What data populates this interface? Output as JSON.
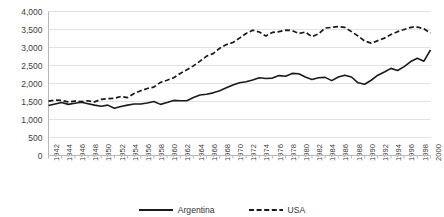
{
  "chart_data": {
    "type": "line",
    "title": "",
    "subtitle": "",
    "xlabel": "",
    "ylabel": "",
    "ylim": [
      0,
      4000
    ],
    "xlim": [
      1942,
      2000
    ],
    "grid": true,
    "grid_axis": "y",
    "legend_position": "bottom",
    "y_ticks": [
      0,
      500,
      1000,
      1500,
      2000,
      2500,
      3000,
      3500,
      4000
    ],
    "y_tick_labels": [
      "0",
      "500",
      "1,000",
      "1,500",
      "2,000",
      "2,500",
      "3,000",
      "3,500",
      "4,000"
    ],
    "x_tick_labels": [
      "1942",
      "1944",
      "1946",
      "1948",
      "1950",
      "1952",
      "1954",
      "1956",
      "1958",
      "1960",
      "1962",
      "1964",
      "1966",
      "1968",
      "1970",
      "1972",
      "1974",
      "1976",
      "1978",
      "1980",
      "1982",
      "1984",
      "1986",
      "1988",
      "1990",
      "1992",
      "1994",
      "1996",
      "1998",
      "2000"
    ],
    "x": [
      1942,
      1943,
      1944,
      1945,
      1946,
      1947,
      1948,
      1949,
      1950,
      1951,
      1952,
      1953,
      1954,
      1955,
      1956,
      1957,
      1958,
      1959,
      1960,
      1961,
      1962,
      1963,
      1964,
      1965,
      1966,
      1967,
      1968,
      1969,
      1970,
      1971,
      1972,
      1973,
      1974,
      1975,
      1976,
      1977,
      1978,
      1979,
      1980,
      1981,
      1982,
      1983,
      1984,
      1985,
      1986,
      1987,
      1988,
      1989,
      1990,
      1991,
      1992,
      1993,
      1994,
      1995,
      1996,
      1997,
      1998,
      1999,
      2000
    ],
    "series": [
      {
        "name": "Argentina",
        "style": "solid",
        "color": "#1a1a1a",
        "values": [
          1390,
          1430,
          1470,
          1420,
          1450,
          1480,
          1440,
          1400,
          1370,
          1400,
          1310,
          1360,
          1400,
          1430,
          1430,
          1460,
          1500,
          1420,
          1470,
          1530,
          1520,
          1520,
          1610,
          1680,
          1700,
          1740,
          1800,
          1880,
          1960,
          2020,
          2050,
          2100,
          2160,
          2140,
          2150,
          2220,
          2200,
          2280,
          2270,
          2180,
          2110,
          2160,
          2170,
          2080,
          2180,
          2230,
          2180,
          2020,
          1980,
          2090,
          2230,
          2320,
          2420,
          2360,
          2470,
          2610,
          2700,
          2620,
          2930
        ]
      },
      {
        "name": "USA",
        "style": "dashed",
        "color": "#1a1a1a",
        "values": [
          1510,
          1540,
          1530,
          1490,
          1510,
          1500,
          1520,
          1490,
          1560,
          1580,
          1590,
          1640,
          1610,
          1720,
          1800,
          1860,
          1900,
          2030,
          2090,
          2160,
          2280,
          2380,
          2490,
          2620,
          2760,
          2830,
          2980,
          3080,
          3140,
          3260,
          3390,
          3480,
          3430,
          3320,
          3420,
          3440,
          3480,
          3470,
          3390,
          3430,
          3300,
          3380,
          3540,
          3560,
          3580,
          3560,
          3440,
          3320,
          3180,
          3120,
          3190,
          3260,
          3360,
          3440,
          3500,
          3560,
          3570,
          3520,
          3400
        ]
      }
    ]
  },
  "legend": {
    "items": [
      {
        "label": "Argentina",
        "style": "solid"
      },
      {
        "label": "USA",
        "style": "dashed"
      }
    ]
  },
  "colors": {
    "line": "#1a1a1a",
    "grid": "#e2e2e2",
    "axis": "#b8b8b8",
    "tick_text": "#404040"
  }
}
